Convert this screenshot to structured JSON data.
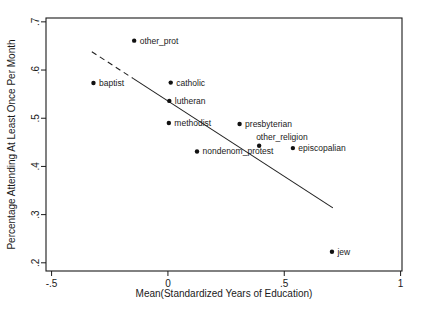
{
  "figure": {
    "background": "#ffffff",
    "frame_color": "#1a1a1a",
    "text_color": "#1a1a1a",
    "marker_color": "#111111",
    "line_color": "#222222"
  },
  "chart_data": {
    "type": "scatter",
    "title": "",
    "xlabel": "Mean(Standardized Years of Education)",
    "ylabel": "Percentage Attending At Least Once Per Month",
    "xlim": [
      -0.524,
      1.006
    ],
    "ylim": [
      0.183,
      0.708
    ],
    "grid": false,
    "legend": false,
    "x_ticks": [
      {
        "value": -0.5,
        "label": "-.5"
      },
      {
        "value": 0,
        "label": "0"
      },
      {
        "value": 0.5,
        "label": ".5"
      },
      {
        "value": 1,
        "label": "1"
      }
    ],
    "y_ticks": [
      {
        "value": 0.2,
        "label": ".2"
      },
      {
        "value": 0.3,
        "label": ".3"
      },
      {
        "value": 0.4,
        "label": ".4"
      },
      {
        "value": 0.5,
        "label": ".5"
      },
      {
        "value": 0.6,
        "label": ".6"
      },
      {
        "value": 0.7,
        "label": ".7"
      }
    ],
    "points": [
      {
        "label": "other_prot",
        "x": -0.145,
        "y": 0.661,
        "label_pos": "right"
      },
      {
        "label": "baptist",
        "x": -0.32,
        "y": 0.573,
        "label_pos": "right"
      },
      {
        "label": "catholic",
        "x": 0.012,
        "y": 0.574,
        "label_pos": "right"
      },
      {
        "label": "lutheran",
        "x": 0.006,
        "y": 0.536,
        "label_pos": "right"
      },
      {
        "label": "methodist",
        "x": 0.004,
        "y": 0.49,
        "label_pos": "right"
      },
      {
        "label": "presbyterian",
        "x": 0.308,
        "y": 0.488,
        "label_pos": "right"
      },
      {
        "label": "other_religion",
        "x": 0.392,
        "y": 0.443,
        "label_pos": "above-right"
      },
      {
        "label": "episcopalian",
        "x": 0.537,
        "y": 0.438,
        "label_pos": "right"
      },
      {
        "label": "nondenom_protest",
        "x": 0.125,
        "y": 0.431,
        "label_pos": "right"
      },
      {
        "label": "jew",
        "x": 0.705,
        "y": 0.223,
        "label_pos": "right"
      }
    ],
    "fit_line": {
      "x1": -0.327,
      "y1": 0.638,
      "x2": 0.709,
      "y2": 0.314,
      "dash_until_x": -0.15,
      "start_style": "dashed",
      "rest_style": "solid"
    }
  }
}
